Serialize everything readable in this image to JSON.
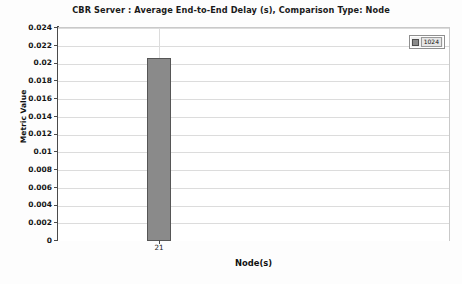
{
  "chart_data": {
    "type": "bar",
    "title": "CBR Server :  Average End-to-End Delay (s), Comparison Type: Node",
    "xlabel": "Node(s)",
    "ylabel": "Metric Value",
    "categories": [
      "21"
    ],
    "series": [
      {
        "name": "1024",
        "values": [
          0.0206
        ],
        "color": "#8a8a8a"
      }
    ],
    "ylim": [
      0,
      0.024
    ],
    "ytick_labels": [
      "0.024",
      "0.022",
      "0.02",
      "0.018",
      "0.016",
      "0.014",
      "0.012",
      "0.01",
      "0.008",
      "0.006",
      "0.004",
      "0.002",
      "0"
    ],
    "ytick_values": [
      0.024,
      0.022,
      0.02,
      0.018,
      0.016,
      0.014,
      0.012,
      0.01,
      0.008,
      0.006,
      0.004,
      0.002,
      0
    ],
    "grid": true,
    "grid_axis": "both",
    "legend": {
      "position": "top-right-inside",
      "entries": [
        {
          "label": "1024",
          "swatch_name": "legend-swatch-1024",
          "color": "#8a8a8a"
        }
      ]
    },
    "colors": {
      "bar_fill": "#8a8a8a",
      "bar_border": "#565656",
      "axis": "#4a4a4a",
      "gridline": "#dcdcdc",
      "plot_background": "#ffffff",
      "page_background": "#fdfdfd",
      "text": "#111111"
    }
  }
}
